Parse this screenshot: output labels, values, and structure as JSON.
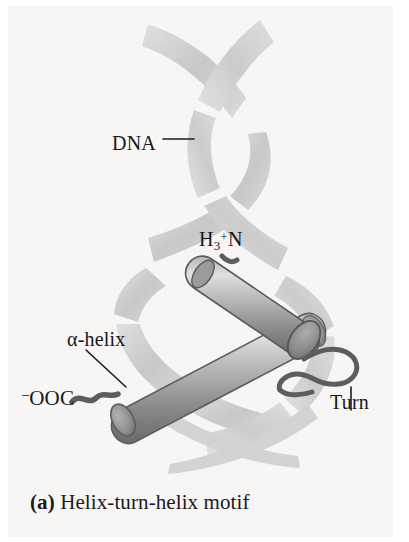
{
  "figure": {
    "caption_tag": "(a)",
    "caption_text": "Helix-turn-helix motif",
    "labels": {
      "dna": "DNA",
      "n_terminus_prefix": "H",
      "n_terminus_sub": "3",
      "n_terminus_sup": "+",
      "n_terminus_suffix": "N",
      "alpha_helix": "α-helix",
      "c_terminus_sup": "–",
      "c_terminus": "OOC",
      "turn": "Turn"
    },
    "colors": {
      "background": "#f7f6f4",
      "page": "#ffffff",
      "dna_ribbon_light": "#d9d9d9",
      "dna_ribbon_dark": "#c3c3c3",
      "helix_cylinder_light": "#dcdcdc",
      "helix_cylinder_mid": "#9a9a9a",
      "helix_cylinder_dark": "#6e6e6e",
      "coil_stroke": "#5a5a5a",
      "text": "#18181a",
      "leader_line": "#1d1d1f"
    },
    "elements": [
      "dna-double-helix",
      "alpha-helix-cylinder-lower",
      "alpha-helix-cylinder-upper",
      "turn-loop-coil",
      "n-terminus-coil",
      "c-terminus-coil"
    ]
  }
}
